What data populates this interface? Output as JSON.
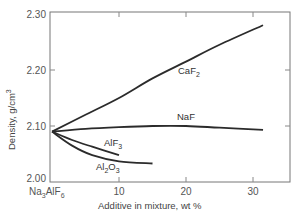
{
  "chart_data": {
    "type": "line",
    "title": "",
    "xlabel": "Additive in mixture, wt %",
    "ylabel": "Density, g/cm3",
    "xlim": [
      0,
      35
    ],
    "ylim": [
      2.0,
      2.3
    ],
    "x_ticks": [
      10,
      20,
      30
    ],
    "x_tick_labels": [
      "10",
      "20",
      "30"
    ],
    "x_origin_label": "Na3AlF6",
    "y_ticks": [
      2.0,
      2.1,
      2.2,
      2.3
    ],
    "y_tick_labels": [
      "2.00",
      "2.10",
      "2.20",
      "2.30"
    ],
    "grid": false,
    "legend": "inline labels",
    "series": [
      {
        "name": "CaF2",
        "x": [
          0,
          5,
          10,
          15,
          20,
          25,
          31.5
        ],
        "values": [
          2.09,
          2.12,
          2.15,
          2.185,
          2.215,
          2.245,
          2.28
        ]
      },
      {
        "name": "NaF",
        "x": [
          0,
          5,
          10,
          15,
          20,
          25,
          31.5
        ],
        "values": [
          2.09,
          2.095,
          2.098,
          2.1,
          2.1,
          2.097,
          2.093
        ]
      },
      {
        "name": "AlF3",
        "x": [
          0,
          3,
          6,
          10
        ],
        "values": [
          2.09,
          2.075,
          2.063,
          2.048
        ]
      },
      {
        "name": "Al2O3",
        "x": [
          0,
          3,
          6,
          10,
          15
        ],
        "values": [
          2.09,
          2.065,
          2.048,
          2.037,
          2.033
        ]
      }
    ]
  },
  "labels": {
    "ylabel_main": "Density, g/cm",
    "ylabel_sup": "3",
    "xlabel": "Additive in mixture, wt %",
    "origin_main1": "Na",
    "origin_sub1": "3",
    "origin_main2": "AlF",
    "origin_sub2": "6",
    "caf2_main": "CaF",
    "caf2_sub": "2",
    "naf": "NaF",
    "alf3_main": "AlF",
    "alf3_sub": "3",
    "al2o3_a": "Al",
    "al2o3_sub1": "2",
    "al2o3_b": "O",
    "al2o3_sub2": "3"
  },
  "colors": {
    "line": "#2b2b2b",
    "axis": "#666666",
    "text": "#555555"
  }
}
